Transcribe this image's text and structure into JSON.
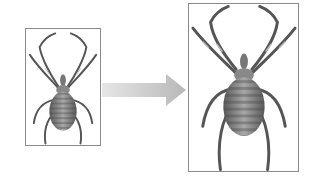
{
  "diagram": {
    "source_image": {
      "label": "spider-small",
      "border_color": "#8a8a8a"
    },
    "arrow": {
      "direction": "right",
      "color": "#c8c8c8"
    },
    "target_image": {
      "label": "spider-large",
      "border_color": "#8a8a8a"
    },
    "colors": {
      "background": "#ffffff",
      "frame": "#8a8a8a",
      "arrow": "#c6c6c6",
      "spider_dark": "#4a4a4a",
      "spider_mid": "#8c8c8c",
      "spider_light": "#bdbdbd"
    }
  }
}
